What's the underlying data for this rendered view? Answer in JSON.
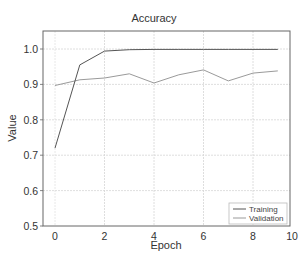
{
  "chart_data": {
    "type": "line",
    "title": "Accuracy",
    "xlabel": "Epoch",
    "ylabel": "Value",
    "x": [
      0,
      1,
      2,
      3,
      4,
      5,
      6,
      7,
      8,
      9
    ],
    "series": [
      {
        "name": "Training",
        "color": "#555555",
        "values": [
          0.72,
          0.955,
          0.994,
          0.998,
          0.999,
          0.999,
          0.999,
          0.999,
          0.999,
          0.999
        ]
      },
      {
        "name": "Validation",
        "color": "#9a9a9a",
        "values": [
          0.897,
          0.913,
          0.918,
          0.93,
          0.904,
          0.927,
          0.941,
          0.91,
          0.932,
          0.938
        ]
      }
    ],
    "xlim": [
      -0.5,
      10
    ],
    "ylim": [
      0.5,
      1.05
    ],
    "xticks": [
      0,
      2,
      4,
      6,
      8,
      10
    ],
    "yticks": [
      0.5,
      0.6,
      0.7,
      0.8,
      0.9,
      1.0
    ],
    "ytick_labels": [
      "0.5",
      "0.6",
      "0.7",
      "0.8",
      "0.9",
      "1.0"
    ],
    "grid": true,
    "legend_position": "lower right"
  }
}
